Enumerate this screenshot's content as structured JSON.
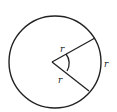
{
  "diagram": {
    "title": "",
    "labels": {
      "upper_radius": "r",
      "lower_radius": "r",
      "arc": "r"
    },
    "colors": {
      "stroke": "#222222",
      "background": "#ffffff"
    }
  }
}
